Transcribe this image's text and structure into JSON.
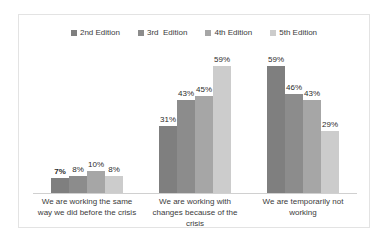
{
  "chart_data": {
    "type": "bar",
    "title": "",
    "subtitle": "",
    "xlabel": "",
    "ylabel": "",
    "ylim": [
      0,
      65
    ],
    "grid": false,
    "legend_position": "top-center",
    "value_suffix": "%",
    "categories": [
      "We are working the same way we did before the crisis",
      "We are working with changes because of the crisis",
      "We are temporarily not working"
    ],
    "series": [
      {
        "name": "2nd Edition",
        "color": "#7f7f7f",
        "values": [
          7,
          31,
          59
        ]
      },
      {
        "name": "3rd  Edition",
        "color": "#8c8c8c",
        "values": [
          8,
          43,
          46
        ]
      },
      {
        "name": "4th Edition",
        "color": "#a6a6a6",
        "values": [
          10,
          45,
          43
        ]
      },
      {
        "name": "5th Edition",
        "color": "#cccccc",
        "values": [
          8,
          59,
          29
        ]
      }
    ],
    "labels": [
      [
        "7%",
        "8%",
        "10%",
        "8%"
      ],
      [
        "31%",
        "43%",
        "45%",
        "59%"
      ],
      [
        "59%",
        "46%",
        "43%",
        "29%"
      ]
    ],
    "emphasized_labels": [
      "7%"
    ]
  }
}
